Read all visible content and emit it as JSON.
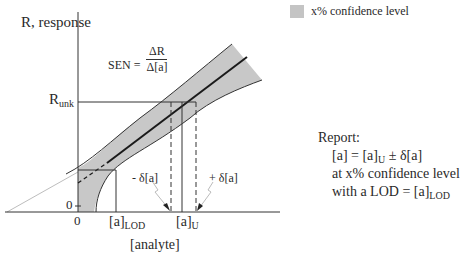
{
  "legend": {
    "swatch_color": "#c4c4c4",
    "label": "x% confidence level"
  },
  "axes": {
    "y_label": "R, response",
    "x_label": "[analyte]",
    "y_zero_tick": "0",
    "x_zero_tick": "0",
    "r_unk_label_main": "R",
    "r_unk_label_sub": "unk",
    "a_lod_label_main": "[a]",
    "a_lod_label_sub": "LOD",
    "a_u_label_main": "[a]",
    "a_u_label_sub": "U"
  },
  "equation": {
    "lhs": "SEN =",
    "numerator": "ΔR",
    "denominator": "Δ[a]"
  },
  "annotations": {
    "minus_delta": "- δ[a]",
    "plus_delta": "+ δ[a]"
  },
  "report": {
    "title": "Report:",
    "line1_a": "[a] = [a]",
    "line1_sub": "U",
    "line1_b": " ± δ[a]",
    "line2": "at x% confidence level",
    "line3_a": "with a LOD = [a]",
    "line3_sub": "LOD"
  },
  "colors": {
    "band_fill": "#c8c8c8",
    "line": "#222222",
    "light_line": "#bdbdbd"
  }
}
